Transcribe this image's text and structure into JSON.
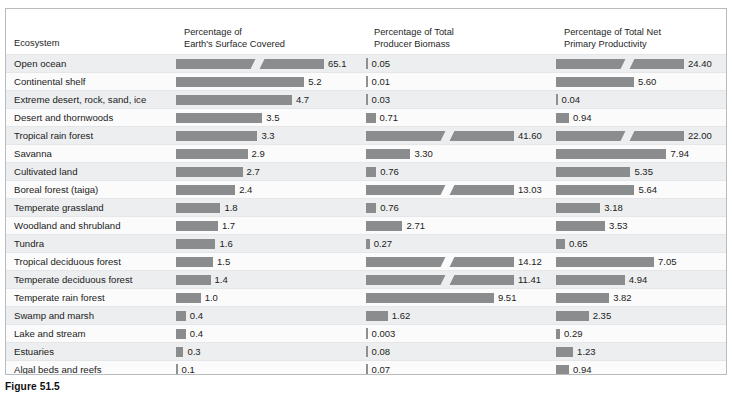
{
  "figure": {
    "caption": "Figure 51.5"
  },
  "table": {
    "headers": {
      "ecosystem": {
        "line1": "Ecosystem",
        "line2": ""
      },
      "surface": {
        "line1": "Percentage of",
        "line2": "Earth's Surface Covered"
      },
      "biomass": {
        "line1": "Percentage of Total",
        "line2": "Producer Biomass"
      },
      "npp": {
        "line1": "Percentage of Total Net",
        "line2": "Primary Productivity"
      }
    },
    "bar_color": "#8b8c8d",
    "row_stripe_odd": "#eceeef",
    "row_stripe_even": "#fbfbfb"
  },
  "chart_data": {
    "type": "bar",
    "title": "Figure 51.5",
    "xlabel": "",
    "ylabel": "Ecosystem",
    "grid": false,
    "legend_position": "none",
    "categories": [
      "Open ocean",
      "Continental shelf",
      "Extreme desert, rock, sand, ice",
      "Desert and thornwoods",
      "Tropical rain forest",
      "Savanna",
      "Cultivated land",
      "Boreal forest (taiga)",
      "Temperate grassland",
      "Woodland and shrubland",
      "Tundra",
      "Tropical deciduous forest",
      "Temperate deciduous forest",
      "Temperate rain forest",
      "Swamp and marsh",
      "Lake and stream",
      "Estuaries",
      "Algal beds and reefs"
    ],
    "series": [
      {
        "name": "Percentage of Earth's Surface Covered",
        "labels": [
          "65.1",
          "5.2",
          "4.7",
          "3.5",
          "3.3",
          "2.9",
          "2.7",
          "2.4",
          "1.8",
          "1.7",
          "1.6",
          "1.5",
          "1.4",
          "1.0",
          "0.4",
          "0.4",
          "0.3",
          "0.1"
        ],
        "values": [
          65.1,
          5.2,
          4.7,
          3.5,
          3.3,
          2.9,
          2.7,
          2.4,
          1.8,
          1.7,
          1.6,
          1.5,
          1.4,
          1.0,
          0.4,
          0.4,
          0.3,
          0.1
        ],
        "axis_max": 6.0,
        "broken": [
          true,
          false,
          false,
          false,
          false,
          false,
          false,
          false,
          false,
          false,
          false,
          false,
          false,
          false,
          false,
          false,
          false,
          false
        ]
      },
      {
        "name": "Percentage of Total Producer Biomass",
        "labels": [
          "0.05",
          "0.01",
          "0.03",
          "0.71",
          "41.60",
          "3.30",
          "0.76",
          "13.03",
          "0.76",
          "2.71",
          "0.27",
          "14.12",
          "11.41",
          "9.51",
          "1.62",
          "0.003",
          "0.08",
          "0.07"
        ],
        "values": [
          0.05,
          0.01,
          0.03,
          0.71,
          41.6,
          3.3,
          0.76,
          13.03,
          0.76,
          2.71,
          0.27,
          14.12,
          11.41,
          9.51,
          1.62,
          0.003,
          0.08,
          0.07
        ],
        "axis_max": 11.0,
        "broken": [
          false,
          false,
          false,
          false,
          true,
          false,
          false,
          true,
          false,
          false,
          false,
          true,
          true,
          false,
          false,
          false,
          false,
          false
        ]
      },
      {
        "name": "Percentage of Total Net Primary Productivity",
        "labels": [
          "24.40",
          "5.60",
          "0.04",
          "0.94",
          "22.00",
          "7.94",
          "5.35",
          "5.64",
          "3.18",
          "3.53",
          "0.65",
          "7.05",
          "4.94",
          "3.82",
          "2.35",
          "0.29",
          "1.23",
          "0.94"
        ],
        "values": [
          24.4,
          5.6,
          0.04,
          0.94,
          22.0,
          7.94,
          5.35,
          5.64,
          3.18,
          3.53,
          0.65,
          7.05,
          4.94,
          3.82,
          2.35,
          0.29,
          1.23,
          0.94
        ],
        "axis_max": 9.2,
        "broken": [
          true,
          false,
          false,
          false,
          true,
          false,
          false,
          false,
          false,
          false,
          false,
          false,
          false,
          false,
          false,
          false,
          false,
          false
        ]
      }
    ]
  }
}
